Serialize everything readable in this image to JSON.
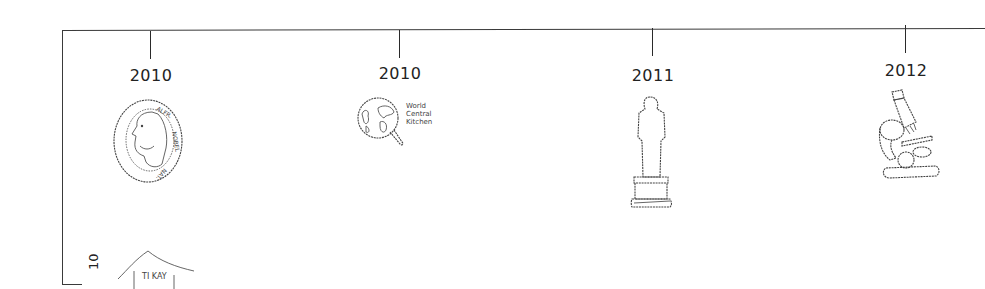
{
  "timeline": {
    "events": [
      {
        "year": "2010",
        "icon": "nobel-medal-icon",
        "icon_text": "ALFR. NOBEL NAT."
      },
      {
        "year": "2010",
        "icon": "world-central-kitchen-icon",
        "icon_text": "World Central Kitchen"
      },
      {
        "year": "2011",
        "icon": "oscar-statuette-icon",
        "icon_text": ""
      },
      {
        "year": "2012",
        "icon": "microscope-icon",
        "icon_text": ""
      }
    ],
    "side_label": "10",
    "partial_icon_text": "TI KAY"
  },
  "colors": {
    "line": "#3a3a3a",
    "text": "#222222",
    "background": "#ffffff"
  }
}
